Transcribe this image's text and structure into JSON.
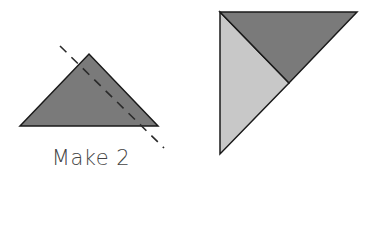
{
  "diagram": {
    "caption": "Make 2",
    "colors": {
      "dark_fill": "#7a7a7a",
      "light_fill": "#c8c8c8",
      "stroke": "#1a1a1a",
      "cut_line": "#2a2a2a",
      "caption_text": "#444444"
    },
    "left_piece": {
      "shape": "half-square triangle",
      "fill": "dark",
      "cut_line": "dashed diagonal"
    },
    "right_piece": {
      "shape": "triangle composed of two smaller triangles",
      "parts": [
        "dark top triangle",
        "light left triangle"
      ]
    }
  }
}
